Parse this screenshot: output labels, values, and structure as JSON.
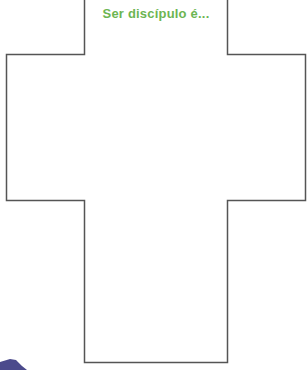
{
  "worksheet": {
    "title": "Ser discípulo é...",
    "title_color": "#6cb552",
    "outline_color": "#555555",
    "shape": "cross",
    "answer_area_text": ""
  },
  "decoration": {
    "corner_shape_color": "#4b4a8c"
  }
}
